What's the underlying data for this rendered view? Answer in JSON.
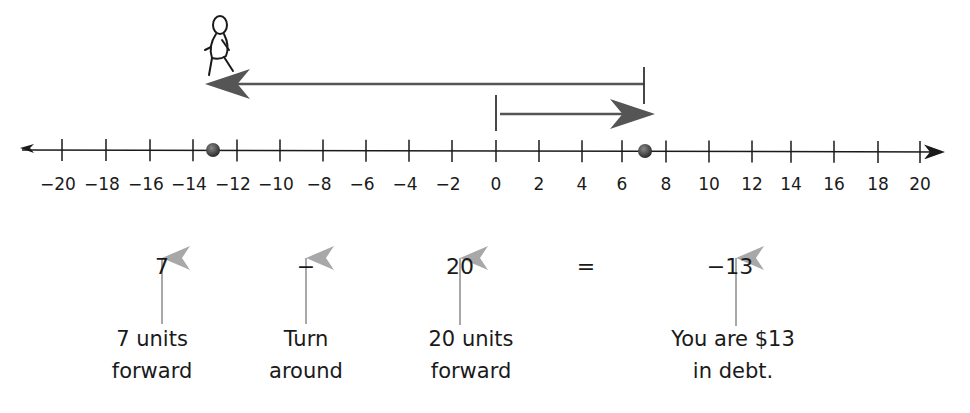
{
  "number_line": {
    "min": -20,
    "max": 20,
    "step": 2,
    "tick_labels": [
      "−20",
      "−18",
      "−16",
      "−14",
      "−12",
      "−10",
      "−8",
      "−6",
      "−4",
      "−2",
      "0",
      "2",
      "4",
      "6",
      "8",
      "10",
      "12",
      "14",
      "16",
      "18",
      "20"
    ],
    "points": [
      {
        "value": -13,
        "label": "end point"
      },
      {
        "value": 7,
        "label": "turn point"
      }
    ]
  },
  "arrows": [
    {
      "from": 0,
      "to": 7,
      "description": "7 units forward"
    },
    {
      "from": 7,
      "to": -13,
      "description": "20 units forward after turning around"
    }
  ],
  "figure": {
    "icon": "person-walking-icon",
    "position": -13
  },
  "equation": {
    "term1": "7",
    "operator": "−",
    "term2": "20",
    "equals": "=",
    "result": "−13"
  },
  "captions": {
    "term1": [
      "7 units",
      "forward"
    ],
    "operator": [
      "Turn",
      "around"
    ],
    "term2": [
      "20 units",
      "forward"
    ],
    "result": [
      "You are $13",
      "in debt."
    ]
  },
  "colors": {
    "axis": "#1a1a1a",
    "arrow": "#555555",
    "pointer": "#a8a8a8",
    "dot": "#3a3a3a"
  }
}
